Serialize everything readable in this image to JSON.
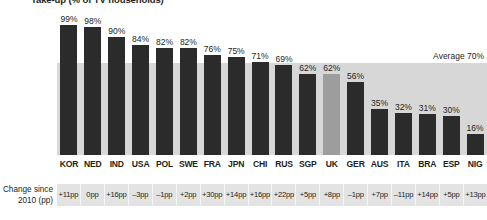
{
  "chart_data": {
    "type": "bar",
    "title": "Take-up (% of TV households)",
    "xlabel": "",
    "ylabel": "",
    "ylim": [
      0,
      100
    ],
    "grid": false,
    "legend": null,
    "annotations": [
      {
        "name": "average-line",
        "label": "Average 70%",
        "value": 70
      }
    ],
    "highlight_category": "UK",
    "colors": {
      "bar": "#2b2b2b",
      "bar_highlight": "#9d9d9d",
      "average_band": "#d7d7d7",
      "change_row_background": "#e3e3e3",
      "text": "#231f20"
    },
    "categories": [
      "KOR",
      "NED",
      "IND",
      "USA",
      "POL",
      "SWE",
      "FRA",
      "JPN",
      "CHI",
      "RUS",
      "SGP",
      "UK",
      "GER",
      "AUS",
      "ITA",
      "BRA",
      "ESP",
      "NIG"
    ],
    "values": [
      99,
      98,
      90,
      84,
      82,
      82,
      76,
      75,
      71,
      69,
      62,
      62,
      56,
      35,
      32,
      31,
      30,
      16
    ],
    "value_labels": [
      "99%",
      "98%",
      "90%",
      "84%",
      "82%",
      "82%",
      "76%",
      "75%",
      "71%",
      "69%",
      "62%",
      "62%",
      "56%",
      "35%",
      "32%",
      "31%",
      "30%",
      "16%"
    ],
    "secondary_series": {
      "name": "Change since 2010 (pp)",
      "caption_line1": "Change since",
      "caption_line2": "2010 (pp)",
      "values": [
        11,
        0,
        16,
        -3,
        -1,
        2,
        30,
        14,
        16,
        22,
        5,
        8,
        -1,
        7,
        -11,
        14,
        5,
        13
      ],
      "labels": [
        "+11pp",
        "0pp",
        "+16pp",
        "–3pp",
        "–1pp",
        "+2pp",
        "+30pp",
        "+14pp",
        "+16pp",
        "+22pp",
        "+5pp",
        "+8pp",
        "–1pp",
        "+7pp",
        "–11pp",
        "+14pp",
        "+5pp",
        "+13pp"
      ]
    }
  }
}
